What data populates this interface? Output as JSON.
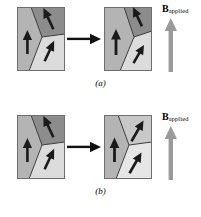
{
  "figure": {
    "panels": [
      {
        "id": "a",
        "caption": "(a)",
        "field_label": {
          "symbol": "B",
          "subscript": "applied"
        },
        "icons": {
          "transition": "right-arrow-icon",
          "field": "field-up-arrow-icon"
        },
        "left_box": {
          "name": "grain-box-no-field",
          "domains": [
            {
              "name": "domain-left-up",
              "fill": "#b4b4b4",
              "moment": "up"
            },
            {
              "name": "domain-topright-down-right",
              "fill": "#8c8c8c",
              "moment": "down-right"
            },
            {
              "name": "domain-bottomright-down-left",
              "fill": "#dcdcdc",
              "moment": "down-left"
            }
          ]
        },
        "right_box": {
          "name": "grain-box-field-applied",
          "domains": [
            {
              "name": "domain-left-up-grown",
              "fill": "#b4b4b4",
              "moment": "up"
            },
            {
              "name": "domain-topright-down-right-shrunk",
              "fill": "#8c8c8c",
              "moment": "down-right"
            },
            {
              "name": "domain-bottomright-down-left-shrunk",
              "fill": "#dcdcdc",
              "moment": "down-left"
            }
          ]
        },
        "mechanism": "domain-wall-motion"
      },
      {
        "id": "b",
        "caption": "(b)",
        "field_label": {
          "symbol": "B",
          "subscript": "applied"
        },
        "icons": {
          "transition": "right-arrow-icon",
          "field": "field-up-arrow-icon"
        },
        "left_box": {
          "name": "grain-box-no-field",
          "domains": [
            {
              "name": "domain-left-up",
              "fill": "#b4b4b4",
              "moment": "up"
            },
            {
              "name": "domain-topright-down-right",
              "fill": "#8c8c8c",
              "moment": "down-right"
            },
            {
              "name": "domain-bottomright-down-left",
              "fill": "#dcdcdc",
              "moment": "down-left"
            }
          ]
        },
        "right_box": {
          "name": "grain-box-field-applied",
          "domains": [
            {
              "name": "domain-left-up",
              "fill": "#b4b4b4",
              "moment": "up"
            },
            {
              "name": "domain-topright-rotated-up-right",
              "fill": "#c8c8c8",
              "moment": "up-right"
            },
            {
              "name": "domain-bottomright-rotated-up-right",
              "fill": "#e6e6e6",
              "moment": "up-right"
            }
          ]
        },
        "mechanism": "domain-rotation"
      }
    ],
    "colors": {
      "domain_dark": "#8c8c8c",
      "domain_mid": "#b4b4b4",
      "domain_light": "#dcdcdc",
      "domain_lighter": "#e6e6e6",
      "moment_arrow": "#1a1a1a",
      "field_arrow": "#9a9a9a",
      "boundary": "#3c3c3c",
      "background": "#ffffff"
    }
  }
}
